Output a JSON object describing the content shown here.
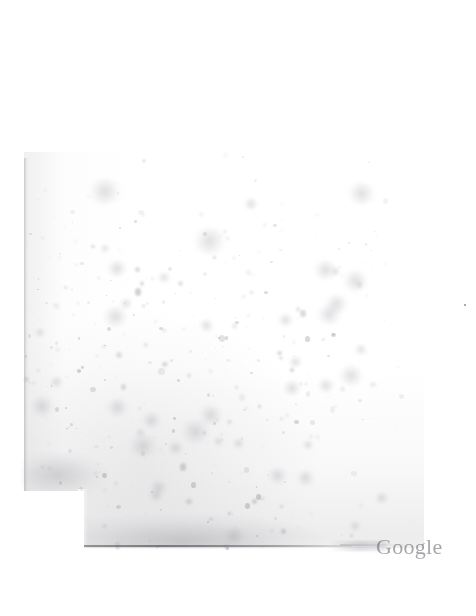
{
  "document": {
    "type": "scanned-book-page",
    "title": "Scanned page",
    "page_condition": "blank page with foxing / age spots",
    "background_color": "#ffffff",
    "paper_tint_color": "#f7f7f8",
    "speckle_color": "#9a9aa0",
    "edge_line_color": "#6a6a72"
  },
  "watermark": {
    "text": "Google",
    "label": "google-books-scan-watermark",
    "color": "#5f5f66"
  },
  "page": {
    "left_edge_label": "page-left-edge",
    "bottom_edge_label": "page-bottom-edge",
    "corner_notch_label": "bottom-left-corner-notch"
  },
  "speckles": {
    "description": "foxing spots across the scanned leaf",
    "count": 560,
    "region": {
      "x": 24,
      "y": 150,
      "width": 400,
      "height": 400
    }
  }
}
